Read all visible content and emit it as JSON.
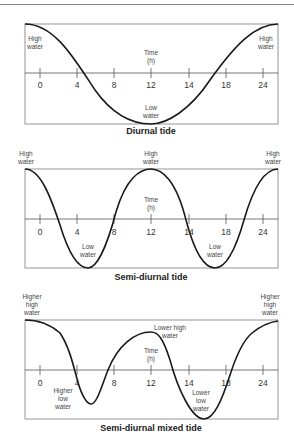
{
  "panels": [
    {
      "title": "Diurnal tide",
      "axis_label_line1": "Time",
      "axis_label_line2": "(h)",
      "ticks": [
        "0",
        "4",
        "8",
        "12",
        "14",
        "18",
        "24"
      ],
      "labels": {
        "high_left": [
          "High",
          "water"
        ],
        "high_right": [
          "High",
          "water"
        ],
        "low_center": [
          "Low",
          "water"
        ]
      }
    },
    {
      "title": "Semi-diurnal tide",
      "axis_label_line1": "Time",
      "axis_label_line2": "(h)",
      "ticks": [
        "0",
        "4",
        "8",
        "12",
        "14",
        "18",
        "24"
      ],
      "labels": {
        "high_left": [
          "High",
          "water"
        ],
        "high_center": [
          "High",
          "water"
        ],
        "high_right": [
          "High",
          "water"
        ],
        "low_1": [
          "Low",
          "water"
        ],
        "low_2": [
          "Low",
          "water"
        ]
      }
    },
    {
      "title": "Semi-diurnal mixed tide",
      "axis_label_line1": "Time",
      "axis_label_line2": "(h)",
      "ticks": [
        "0",
        "4",
        "8",
        "12",
        "14",
        "18",
        "24"
      ],
      "labels": {
        "higher_high_left": [
          "Higher",
          "high",
          "water"
        ],
        "higher_high_right": [
          "Higher",
          "high",
          "water"
        ],
        "lower_high": [
          "Lower high",
          "water"
        ],
        "higher_low": [
          "Higher",
          "low",
          "water"
        ],
        "lower_low": [
          "Lower",
          "low",
          "water"
        ]
      }
    }
  ],
  "colors": {
    "curve": "#1a1a1a",
    "frame": "#7a7a7a",
    "axis": "#555555",
    "text": "#444444",
    "rule": "#8a8a8a"
  }
}
